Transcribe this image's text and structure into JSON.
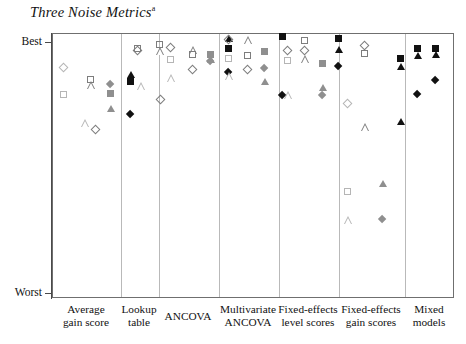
{
  "chart_data": {
    "type": "scatter",
    "title": "Three Noise Metrics",
    "title_superscript": "a",
    "xlabel": "",
    "ylabel": "",
    "grid": false,
    "legend_position": "none",
    "y_axis": {
      "ticks": [
        "Best",
        "Worst"
      ],
      "top_label": "Best",
      "bottom_label": "Worst",
      "direction": "Best at top, Worst at bottom",
      "ylim": [
        0,
        100
      ]
    },
    "categories": [
      "Average gain score",
      "Lookup table",
      "ANCOVA",
      "Multivariate ANCOVA",
      "Fixed-effects level scores",
      "Fixed-effects gain scores",
      "Mixed models"
    ],
    "series": [
      {
        "name": "metric-1-open-light",
        "marker_style": "open light gray",
        "shapes": [
          "diamond",
          "square",
          "triangle"
        ]
      },
      {
        "name": "metric-2-gray",
        "marker_style": "gray filled / gray outline",
        "shapes": [
          "diamond",
          "square",
          "triangle"
        ]
      },
      {
        "name": "metric-3-black",
        "marker_style": "black filled",
        "shapes": [
          "diamond",
          "square",
          "triangle"
        ]
      }
    ],
    "points": [
      {
        "panel": 0,
        "group": 0,
        "shape": "diamond",
        "fill": "open-light",
        "x": 11,
        "y": 34
      },
      {
        "panel": 0,
        "group": 0,
        "shape": "square",
        "fill": "open-light",
        "x": 11,
        "y": 61
      },
      {
        "panel": 0,
        "group": 1,
        "shape": "square",
        "fill": "open-mid",
        "x": 38,
        "y": 46
      },
      {
        "panel": 0,
        "group": 1,
        "shape": "triangle",
        "fill": "open-mid",
        "x": 38,
        "y": 51
      },
      {
        "panel": 0,
        "group": 1,
        "shape": "triangle",
        "fill": "open-light",
        "x": 32,
        "y": 89
      },
      {
        "panel": 0,
        "group": 1,
        "shape": "diamond",
        "fill": "open-mid",
        "x": 43,
        "y": 96
      },
      {
        "panel": 0,
        "group": 2,
        "shape": "diamond",
        "fill": "gray",
        "x": 58,
        "y": 51
      },
      {
        "panel": 0,
        "group": 2,
        "shape": "square",
        "fill": "gray",
        "x": 58,
        "y": 60
      },
      {
        "panel": 0,
        "group": 2,
        "shape": "triangle",
        "fill": "gray",
        "x": 58,
        "y": 75
      },
      {
        "panel": 0,
        "group": 3,
        "shape": "triangle",
        "fill": "black",
        "x": 78,
        "y": 41
      },
      {
        "panel": 0,
        "group": 3,
        "shape": "square",
        "fill": "black",
        "x": 78,
        "y": 48
      },
      {
        "panel": 0,
        "group": 3,
        "shape": "diamond",
        "fill": "black",
        "x": 78,
        "y": 81
      },
      {
        "panel": 1,
        "group": 0,
        "shape": "diamond",
        "fill": "open-mid",
        "x": 17,
        "y": 17
      },
      {
        "panel": 1,
        "group": 0,
        "shape": "square",
        "fill": "open-mid",
        "x": 17,
        "y": 15
      },
      {
        "panel": 1,
        "group": 1,
        "shape": "square",
        "fill": "open-mid",
        "x": 39,
        "y": 11
      },
      {
        "panel": 1,
        "group": 1,
        "shape": "triangle",
        "fill": "open-mid",
        "x": 39,
        "y": 17
      },
      {
        "panel": 1,
        "group": 1,
        "shape": "triangle",
        "fill": "open-light",
        "x": 20,
        "y": 52
      },
      {
        "panel": 1,
        "group": 1,
        "shape": "diamond",
        "fill": "open-mid",
        "x": 40,
        "y": 66
      },
      {
        "panel": 2,
        "group": 0,
        "shape": "diamond",
        "fill": "open-mid",
        "x": 12,
        "y": 14
      },
      {
        "panel": 2,
        "group": 0,
        "shape": "square",
        "fill": "open-light",
        "x": 12,
        "y": 26
      },
      {
        "panel": 2,
        "group": 0,
        "shape": "triangle",
        "fill": "open-light",
        "x": 12,
        "y": 44
      },
      {
        "panel": 2,
        "group": 1,
        "shape": "triangle",
        "fill": "open-mid",
        "x": 34,
        "y": 16
      },
      {
        "panel": 2,
        "group": 1,
        "shape": "square",
        "fill": "open-mid",
        "x": 34,
        "y": 21
      },
      {
        "panel": 2,
        "group": 1,
        "shape": "diamond",
        "fill": "open-mid",
        "x": 34,
        "y": 36
      },
      {
        "panel": 2,
        "group": 2,
        "shape": "square",
        "fill": "gray",
        "x": 52,
        "y": 21
      },
      {
        "panel": 2,
        "group": 2,
        "shape": "diamond",
        "fill": "gray",
        "x": 52,
        "y": 28
      },
      {
        "panel": 2,
        "group": 2,
        "shape": "triangle",
        "fill": "gray",
        "x": 52,
        "y": 26
      },
      {
        "panel": 2,
        "group": 3,
        "shape": "triangle",
        "fill": "black",
        "x": 70,
        "y": 5
      },
      {
        "panel": 2,
        "group": 3,
        "shape": "square",
        "fill": "black",
        "x": 70,
        "y": 15
      },
      {
        "panel": 2,
        "group": 3,
        "shape": "diamond",
        "fill": "black",
        "x": 70,
        "y": 39
      },
      {
        "panel": 3,
        "group": 0,
        "shape": "diamond",
        "fill": "open-mid",
        "x": 10,
        "y": 6
      },
      {
        "panel": 3,
        "group": 0,
        "shape": "square",
        "fill": "open-light",
        "x": 10,
        "y": 25
      },
      {
        "panel": 3,
        "group": 0,
        "shape": "triangle",
        "fill": "open-light",
        "x": 10,
        "y": 42
      },
      {
        "panel": 3,
        "group": 1,
        "shape": "triangle",
        "fill": "open-mid",
        "x": 29,
        "y": 6
      },
      {
        "panel": 3,
        "group": 1,
        "shape": "square",
        "fill": "open-mid",
        "x": 29,
        "y": 22
      },
      {
        "panel": 3,
        "group": 1,
        "shape": "diamond",
        "fill": "open-mid",
        "x": 29,
        "y": 36
      },
      {
        "panel": 3,
        "group": 2,
        "shape": "square",
        "fill": "gray",
        "x": 46,
        "y": 18
      },
      {
        "panel": 3,
        "group": 2,
        "shape": "diamond",
        "fill": "gray",
        "x": 46,
        "y": 35
      },
      {
        "panel": 3,
        "group": 2,
        "shape": "triangle",
        "fill": "gray",
        "x": 46,
        "y": 48
      },
      {
        "panel": 3,
        "group": 3,
        "shape": "square",
        "fill": "black",
        "x": 64,
        "y": 3
      },
      {
        "panel": 3,
        "group": 3,
        "shape": "diamond",
        "fill": "black",
        "x": 64,
        "y": 62
      },
      {
        "panel": 4,
        "group": 0,
        "shape": "diamond",
        "fill": "open-mid",
        "x": 9,
        "y": 17
      },
      {
        "panel": 4,
        "group": 0,
        "shape": "square",
        "fill": "open-light",
        "x": 9,
        "y": 27
      },
      {
        "panel": 4,
        "group": 0,
        "shape": "triangle",
        "fill": "open-light",
        "x": 9,
        "y": 61
      },
      {
        "panel": 4,
        "group": 1,
        "shape": "square",
        "fill": "open-mid",
        "x": 26,
        "y": 7
      },
      {
        "panel": 4,
        "group": 1,
        "shape": "diamond",
        "fill": "open-mid",
        "x": 26,
        "y": 17
      },
      {
        "panel": 4,
        "group": 1,
        "shape": "triangle",
        "fill": "open-mid",
        "x": 26,
        "y": 25
      },
      {
        "panel": 4,
        "group": 2,
        "shape": "square",
        "fill": "gray",
        "x": 44,
        "y": 30
      },
      {
        "panel": 4,
        "group": 2,
        "shape": "triangle",
        "fill": "gray",
        "x": 44,
        "y": 54
      },
      {
        "panel": 4,
        "group": 2,
        "shape": "diamond",
        "fill": "gray",
        "x": 44,
        "y": 62
      },
      {
        "panel": 4,
        "group": 3,
        "shape": "square",
        "fill": "black",
        "x": 60,
        "y": 5
      },
      {
        "panel": 4,
        "group": 3,
        "shape": "triangle",
        "fill": "black",
        "x": 60,
        "y": 16
      },
      {
        "panel": 4,
        "group": 3,
        "shape": "diamond",
        "fill": "black",
        "x": 60,
        "y": 33
      },
      {
        "panel": 5,
        "group": 0,
        "shape": "diamond",
        "fill": "open-mid",
        "x": 26,
        "y": 12
      },
      {
        "panel": 5,
        "group": 0,
        "shape": "square",
        "fill": "open-mid",
        "x": 26,
        "y": 20
      },
      {
        "panel": 5,
        "group": 0,
        "shape": "diamond",
        "fill": "open-light",
        "x": 9,
        "y": 70
      },
      {
        "panel": 5,
        "group": 1,
        "shape": "triangle",
        "fill": "open-mid",
        "x": 26,
        "y": 93
      },
      {
        "panel": 5,
        "group": 1,
        "shape": "square",
        "fill": "open-light",
        "x": 9,
        "y": 158
      },
      {
        "panel": 5,
        "group": 1,
        "shape": "triangle",
        "fill": "open-light",
        "x": 9,
        "y": 186
      },
      {
        "panel": 5,
        "group": 2,
        "shape": "triangle",
        "fill": "gray",
        "x": 44,
        "y": 150
      },
      {
        "panel": 5,
        "group": 2,
        "shape": "diamond",
        "fill": "gray",
        "x": 44,
        "y": 186
      },
      {
        "panel": 5,
        "group": 3,
        "shape": "square",
        "fill": "black",
        "x": 62,
        "y": 25
      },
      {
        "panel": 5,
        "group": 3,
        "shape": "triangle",
        "fill": "black",
        "x": 62,
        "y": 33
      },
      {
        "panel": 5,
        "group": 3,
        "shape": "triangle",
        "fill": "black",
        "x": 62,
        "y": 88
      },
      {
        "panel": 6,
        "group": 0,
        "shape": "square",
        "fill": "black",
        "x": 13,
        "y": 15
      },
      {
        "panel": 6,
        "group": 0,
        "shape": "triangle",
        "fill": "black",
        "x": 13,
        "y": 22
      },
      {
        "panel": 6,
        "group": 0,
        "shape": "diamond",
        "fill": "black",
        "x": 13,
        "y": 61
      },
      {
        "panel": 6,
        "group": 1,
        "shape": "square",
        "fill": "black",
        "x": 31,
        "y": 15
      },
      {
        "panel": 6,
        "group": 1,
        "shape": "triangle",
        "fill": "black",
        "x": 31,
        "y": 21
      },
      {
        "panel": 6,
        "group": 1,
        "shape": "diamond",
        "fill": "black",
        "x": 31,
        "y": 47
      }
    ]
  },
  "colors": {
    "frame": "#6f6f6f",
    "divider": "#b9b9b9",
    "series_light": "#b5b5b5",
    "series_gray": "#8f8f8f",
    "series_black": "#111111",
    "background": "#ffffff"
  },
  "axis": {
    "best_label": "Best",
    "worst_label": "Worst"
  },
  "categories_display": [
    {
      "line1": "Average",
      "line2": "gain score"
    },
    {
      "line1": "Lookup",
      "line2": "table"
    },
    {
      "line1": "ANCOVA",
      "line2": ""
    },
    {
      "line1": "Multivariate",
      "line2": "ANCOVA"
    },
    {
      "line1": "Fixed-effects",
      "line2": "level scores"
    },
    {
      "line1": "Fixed-effects",
      "line2": "gain scores"
    },
    {
      "line1": "Mixed",
      "line2": "models"
    }
  ]
}
